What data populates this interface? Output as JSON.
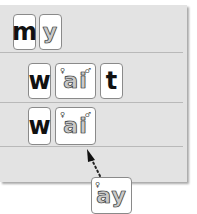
{
  "scene": {
    "description": "Phonics word-building board with letter cards",
    "panel_color": "#e3e3e3",
    "rows": [
      {
        "cards": [
          {
            "text": "m",
            "style": "plain"
          },
          {
            "text": "y",
            "style": "illustrated"
          }
        ]
      },
      {
        "cards": [
          {
            "text": "w",
            "style": "plain"
          },
          {
            "text": "ai",
            "style": "illustrated"
          },
          {
            "text": "t",
            "style": "plain"
          }
        ]
      },
      {
        "cards": [
          {
            "text": "w",
            "style": "plain"
          },
          {
            "text": "ai",
            "style": "illustrated"
          }
        ]
      }
    ],
    "dragged_card": {
      "text": "ay",
      "style": "illustrated"
    },
    "arrow": {
      "style": "dotted",
      "direction": "up-left",
      "target": "row 3, after ai"
    }
  }
}
